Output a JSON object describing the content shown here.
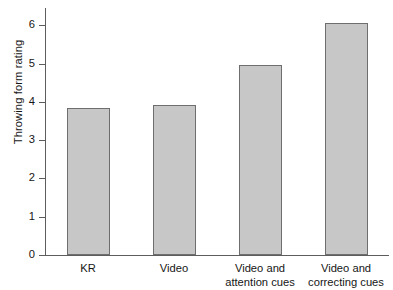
{
  "chart_data": {
    "type": "bar",
    "title": "",
    "subtitle": "",
    "xlabel": "",
    "ylabel": "Throwing form rating",
    "categories": [
      "KR",
      "Video",
      "Video and\nattention cues",
      "Video and\ncorrecting cues"
    ],
    "values": [
      3.85,
      3.93,
      4.97,
      6.05
    ],
    "ylim": [
      0,
      6.45
    ],
    "yticks": [
      0,
      1,
      2,
      3,
      4,
      5,
      6
    ],
    "ytick_labels": [
      "0",
      "1",
      "2",
      "3",
      "4",
      "5",
      "6"
    ],
    "grid": false,
    "legend": null,
    "legend_position": "none",
    "bar_fill_color": "#c7c7c7",
    "bar_edge_color": "#6e6e6e",
    "axis_color": "#5d5d5d",
    "background_color": "#ffffff"
  },
  "axes": {
    "y_title": "Throwing form rating"
  }
}
